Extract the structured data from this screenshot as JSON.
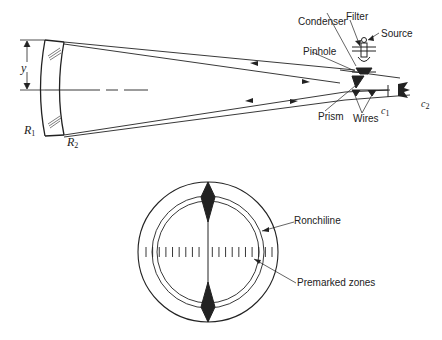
{
  "figure": {
    "top_diagram": {
      "labels": {
        "condenser": "Condenser",
        "filter": "Filter",
        "source": "Source",
        "pinhole": "Pinhole",
        "prism": "Prism",
        "wires": "Wires",
        "y": "y",
        "r1": "R",
        "r1_sub": "1",
        "r2": "R",
        "r2_sub": "2",
        "c1": "c",
        "c1_sub": "1",
        "c2": "c",
        "c2_sub": "2"
      }
    },
    "bottom_diagram": {
      "labels": {
        "ronchiline": "Ronchiline",
        "premarked_zones": "Premarked zones"
      },
      "tick_count": 20
    },
    "colors": {
      "line": "#222222",
      "background": "#ffffff"
    }
  }
}
